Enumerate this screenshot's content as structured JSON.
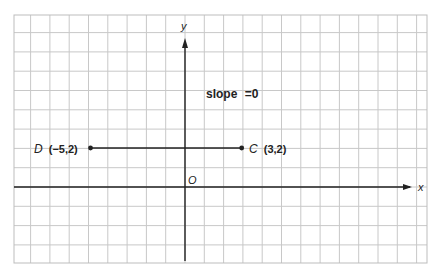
{
  "chart_data": {
    "type": "line",
    "title": "",
    "xlabel": "x",
    "ylabel": "y",
    "origin_label": "O",
    "annotation": "slope = 0",
    "grid": true,
    "grid_x_range": [
      -9,
      13
    ],
    "grid_y_range": [
      -4,
      9
    ],
    "points": [
      {
        "name": "D",
        "x": -5,
        "y": 2,
        "label": "(−5,2)"
      },
      {
        "name": "C",
        "x": 3,
        "y": 2,
        "label": "(3,2)"
      }
    ],
    "series": [
      {
        "name": "segment DC",
        "x": [
          -5,
          3
        ],
        "y": [
          2,
          2
        ]
      }
    ]
  },
  "labels": {
    "y_axis": "y",
    "x_axis": "x",
    "origin": "O",
    "slope_word": "slope",
    "slope_eq": "=0",
    "point_d_name": "D",
    "point_d_coords": "(−5,2)",
    "point_c_name": "C",
    "point_c_coords": "(3,2)"
  }
}
